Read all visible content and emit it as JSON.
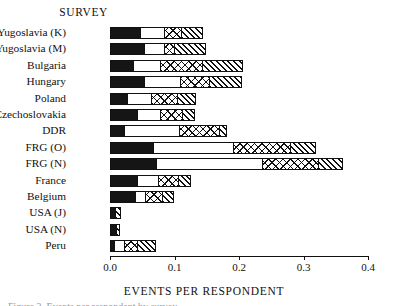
{
  "figure": {
    "survey_heading": "SURVEY",
    "x_axis_title": "EVENTS PER RESPONDENT",
    "caption_partial": "Figure 3. Events per respondent by survey."
  },
  "chart_data": {
    "type": "bar",
    "orientation": "horizontal",
    "stacked": true,
    "title": "SURVEY",
    "xlabel": "EVENTS PER RESPONDENT",
    "ylabel": "",
    "xlim": [
      0.0,
      0.4
    ],
    "grid": false,
    "legend": "none",
    "tick_labels": [
      "0.0",
      "0.1",
      "0.2",
      "0.3",
      "0.4"
    ],
    "tick_values": [
      0.0,
      0.1,
      0.2,
      0.3,
      0.4
    ],
    "categories": [
      "Yugoslavia (K)",
      "Yugoslavia (M)",
      "Bulgaria",
      "Hungary",
      "Poland",
      "Czechoslovakia",
      "DDR",
      "FRG (O)",
      "FRG (N)",
      "France",
      "Belgium",
      "USA (J)",
      "USA (N)",
      "Peru"
    ],
    "series": [
      {
        "name": "segment-1",
        "pattern": "solid-black",
        "values": [
          0.047,
          0.052,
          0.036,
          0.053,
          0.027,
          0.042,
          0.022,
          0.066,
          0.072,
          0.042,
          0.039,
          0.008,
          0.009,
          0.006
        ]
      },
      {
        "name": "segment-2",
        "pattern": "open-white",
        "values": [
          0.036,
          0.031,
          0.042,
          0.055,
          0.036,
          0.035,
          0.085,
          0.124,
          0.163,
          0.032,
          0.016,
          0.0,
          0.0,
          0.016
        ]
      },
      {
        "name": "segment-3",
        "pattern": "cross-hatch",
        "values": [
          0.027,
          0.016,
          0.065,
          0.046,
          0.041,
          0.034,
          0.062,
          0.089,
          0.087,
          0.031,
          0.025,
          0.0,
          0.0,
          0.02
        ]
      },
      {
        "name": "segment-4",
        "pattern": "diagonal-hatch",
        "values": [
          0.034,
          0.05,
          0.063,
          0.05,
          0.029,
          0.021,
          0.013,
          0.04,
          0.04,
          0.02,
          0.019,
          0.009,
          0.007,
          0.03
        ]
      }
    ],
    "totals": [
      0.144,
      0.149,
      0.206,
      0.204,
      0.133,
      0.132,
      0.182,
      0.319,
      0.362,
      0.125,
      0.099,
      0.017,
      0.016,
      0.072
    ]
  },
  "colors": {
    "ink": "#111111",
    "paper": "#ffffff"
  }
}
